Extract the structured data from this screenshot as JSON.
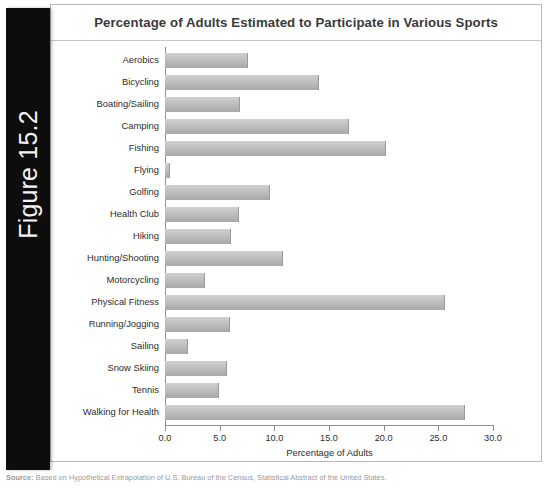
{
  "figure": {
    "tab_label": "Figure 15.2"
  },
  "chart": {
    "title": "Percentage of Adults Estimated to Participate in Various Sports"
  },
  "source": {
    "label": "Source:",
    "text": "Based on Hypothetical Extrapolation of U.S. Bureau of the Census, Statistical Abstract of the United States."
  },
  "colors": {
    "tab_background": "#0d0d0d",
    "tab_text": "#f2f2f2",
    "bar_light": "#d0d0d0",
    "bar_dark": "#a9a9a9",
    "axis": "#8f8f8f",
    "panel_border": "#b8b8b8",
    "title_text": "#3a3a3a"
  },
  "chart_data": {
    "type": "bar",
    "orientation": "horizontal",
    "title": "Percentage of Adults Estimated to Participate in Various Sports",
    "xlabel": "Percentage of Adults",
    "ylabel": "",
    "xlim": [
      0.0,
      30.0
    ],
    "xticks": [
      "0.0",
      "5.0",
      "10.0",
      "15.0",
      "20.0",
      "25.0",
      "30.0"
    ],
    "xtick_values": [
      0,
      5,
      10,
      15,
      20,
      25,
      30
    ],
    "grid": false,
    "legend": false,
    "categories": [
      "Aerobics",
      "Bicycling",
      "Boating/Sailing",
      "Camping",
      "Fishing",
      "Flying",
      "Golfing",
      "Health Club",
      "Hiking",
      "Hunting/Shooting",
      "Motorcycling",
      "Physical Fitness",
      "Running/Jogging",
      "Sailing",
      "Snow Skiing",
      "Tennis",
      "Walking for Health"
    ],
    "values": [
      7.6,
      14.1,
      6.9,
      16.8,
      20.2,
      0.5,
      9.6,
      6.8,
      6.0,
      10.8,
      3.7,
      25.6,
      5.9,
      2.1,
      5.7,
      4.9,
      27.4
    ]
  }
}
